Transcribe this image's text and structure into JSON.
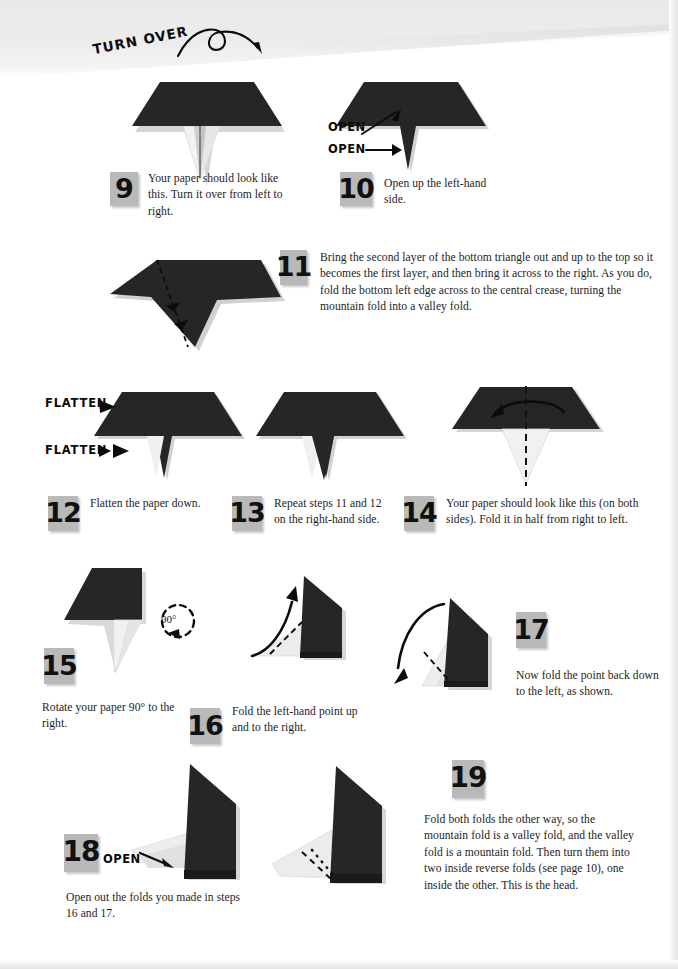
{
  "page": {
    "kind": "origami-instruction-page",
    "background_color": "#ffffff",
    "ink_color": "#1d1d1d",
    "paper_dark_color": "#262626",
    "paper_light_color": "#f0f0f0",
    "badge_color": "#b9b9b9"
  },
  "callouts": [
    {
      "id": "turn-over",
      "text": "TURN OVER"
    },
    {
      "id": "open-upper",
      "text": "OPEN"
    },
    {
      "id": "open-lower",
      "text": "OPEN"
    },
    {
      "id": "flatten-upper",
      "text": "FLATTEN"
    },
    {
      "id": "flatten-lower",
      "text": "FLATTEN"
    },
    {
      "id": "rotate-angle",
      "text": "90°"
    },
    {
      "id": "open-step18",
      "text": "OPEN"
    }
  ],
  "steps": [
    {
      "number": "9",
      "text": "Your paper should look like this. Turn it over from left to right."
    },
    {
      "number": "10",
      "text": "Open up the left-hand side."
    },
    {
      "number": "11",
      "text": "Bring the second layer of the bottom triangle out and up to the top so it becomes the first layer, and then bring it across to the right. As you do, fold the bottom left edge across to the central crease, turning the mountain fold into a valley fold."
    },
    {
      "number": "12",
      "text": "Flatten the paper down."
    },
    {
      "number": "13",
      "text": "Repeat steps 11 and 12 on the right-hand side."
    },
    {
      "number": "14",
      "text": "Your paper should look like this (on both sides). Fold it in half from right to left."
    },
    {
      "number": "15",
      "text": "Rotate your paper 90° to the right."
    },
    {
      "number": "16",
      "text": "Fold the left-hand point up and to the right."
    },
    {
      "number": "17",
      "text": "Now fold the point back down to the left, as shown."
    },
    {
      "number": "18",
      "text": "Open out the folds you made in steps 16 and 17."
    },
    {
      "number": "19",
      "text": "Fold both folds the other way, so the mountain fold is a valley fold, and the valley fold is a mountain fold. Then turn them into two inside reverse folds (see page 10), one inside the other. This is the head."
    }
  ]
}
